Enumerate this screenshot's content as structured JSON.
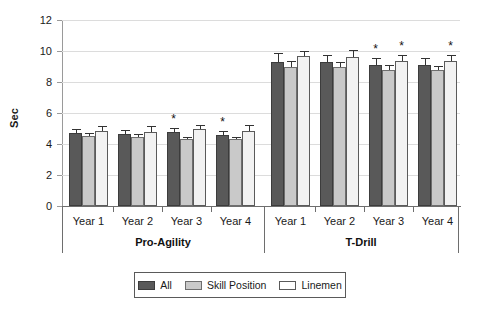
{
  "chart_data": {
    "type": "bar",
    "title": "",
    "xlabel": "",
    "ylabel": "Sec",
    "ylim": [
      0,
      12
    ],
    "yticks": [
      0,
      2,
      4,
      6,
      8,
      10,
      12
    ],
    "grid": true,
    "legend_position": "bottom",
    "categories": [
      "Year 1",
      "Year 2",
      "Year 3",
      "Year 4",
      "Year 1",
      "Year 2",
      "Year 3",
      "Year 4"
    ],
    "group_labels": [
      "Pro-Agility",
      "T-Drill"
    ],
    "series": [
      {
        "name": "All",
        "color": "#595959",
        "values": [
          4.7,
          4.65,
          4.75,
          4.55,
          9.3,
          9.3,
          9.1,
          9.1
        ],
        "errors": [
          0.3,
          0.25,
          0.3,
          0.3,
          0.55,
          0.45,
          0.45,
          0.45
        ]
      },
      {
        "name": "Skill Position",
        "color": "#c9c9c9",
        "values": [
          4.5,
          4.45,
          4.3,
          4.3,
          8.95,
          8.95,
          8.8,
          8.75
        ],
        "errors": [
          0.2,
          0.2,
          0.15,
          0.15,
          0.4,
          0.35,
          0.3,
          0.3
        ]
      },
      {
        "name": "Linemen",
        "color": "#f2f2f2",
        "values": [
          4.85,
          4.8,
          4.95,
          4.85,
          9.65,
          9.6,
          9.35,
          9.35
        ],
        "errors": [
          0.3,
          0.35,
          0.25,
          0.35,
          0.35,
          0.45,
          0.4,
          0.4
        ]
      }
    ],
    "annotations": [
      {
        "label": "*",
        "group_index": 2,
        "series_index": 0
      },
      {
        "label": "*",
        "group_index": 3,
        "series_index": 0
      },
      {
        "label": "*",
        "group_index": 6,
        "series_index": 0
      },
      {
        "label": "*",
        "group_index": 6,
        "series_index": 2
      },
      {
        "label": "*",
        "group_index": 7,
        "series_index": 2
      }
    ]
  }
}
